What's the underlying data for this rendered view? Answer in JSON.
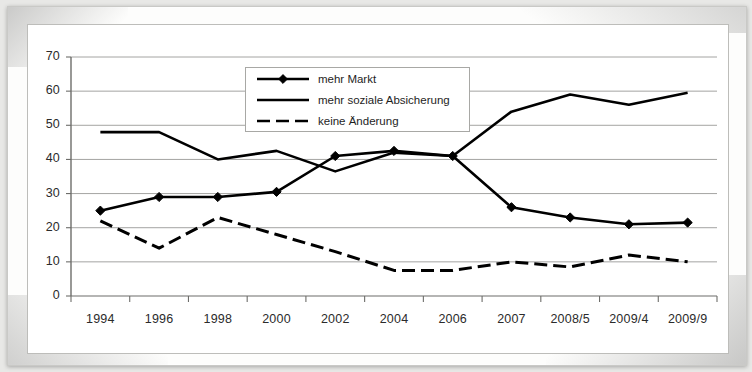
{
  "chart_data": {
    "type": "line",
    "title": "",
    "xlabel": "",
    "ylabel": "",
    "ylim": [
      0,
      70
    ],
    "ytick_step": 10,
    "yticks": [
      "0",
      "10",
      "20",
      "30",
      "40",
      "50",
      "60",
      "70"
    ],
    "grid": true,
    "legend_position": "top-center-inside",
    "categories": [
      "1994",
      "1996",
      "1998",
      "2000",
      "2002",
      "2004",
      "2006",
      "2007",
      "2008/5",
      "2009/4",
      "2009/9"
    ],
    "series": [
      {
        "name": "mehr Markt",
        "style": "solid-with-diamond-markers",
        "color": "#000000",
        "values": [
          25,
          29,
          29,
          30.5,
          41,
          42.5,
          41,
          26,
          23,
          21,
          21.5
        ]
      },
      {
        "name": "mehr soziale Absicherung",
        "style": "solid",
        "color": "#000000",
        "values": [
          48,
          48,
          40,
          42.5,
          36.5,
          42,
          41,
          54,
          59,
          56,
          59.5
        ]
      },
      {
        "name": "keine Änderung",
        "style": "dashed",
        "color": "#000000",
        "values": [
          22,
          14,
          23,
          18,
          13,
          7.5,
          7.5,
          10,
          8.5,
          12,
          10
        ]
      }
    ]
  },
  "legend": {
    "items": [
      {
        "label": "mehr Markt",
        "icon": "line-with-diamond-marker"
      },
      {
        "label": "mehr soziale Absicherung",
        "icon": "solid-line"
      },
      {
        "label": "keine Änderung",
        "icon": "dashed-line"
      }
    ]
  }
}
